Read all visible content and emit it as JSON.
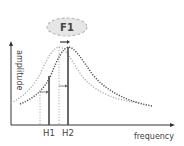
{
  "diagram": {
    "bubble_label": "F1",
    "y_axis_label": "amplitude",
    "x_axis_label": "frequency",
    "markers": [
      {
        "label": "H1"
      },
      {
        "label": "H2"
      }
    ],
    "colors": {
      "axis": "#333333",
      "curve_original": "#b0b0b0",
      "curve_shifted": "#555555",
      "bubble_fill": "#e6e6e6",
      "bubble_border": "#bbbbbb",
      "marker_line": "#444444"
    }
  }
}
